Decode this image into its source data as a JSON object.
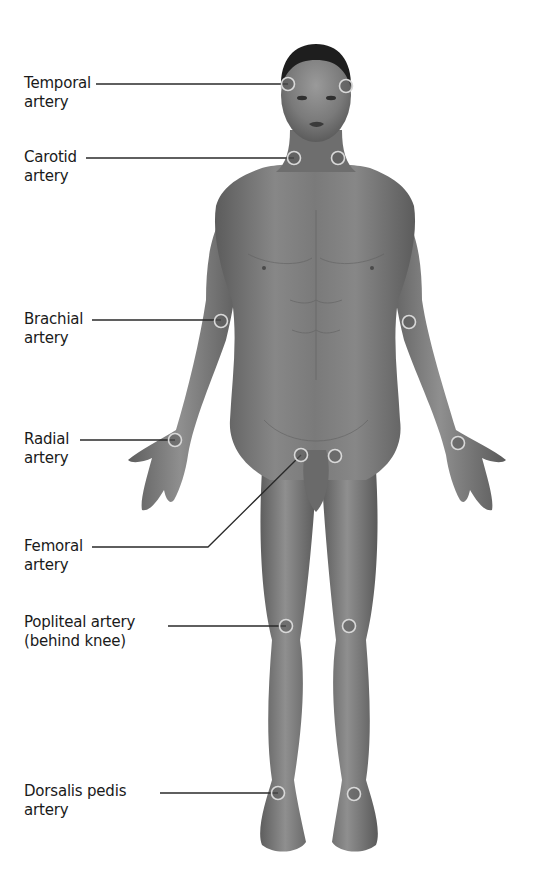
{
  "diagram": {
    "colors": {
      "background": "#ffffff",
      "skin_dark": "#5a5a5a",
      "skin_mid": "#7d7d7d",
      "skin_light": "#9a9a9a",
      "hair": "#1e1e1e",
      "marker_ring": "#d9d9d9",
      "leader_line": "#2a2a2a",
      "text": "#1a1a1a"
    },
    "labels": [
      {
        "id": "temporal",
        "line1": "Temporal",
        "line2": "artery",
        "x": 24,
        "y": 74,
        "leader": [
          [
            96,
            84
          ],
          [
            288,
            84
          ]
        ]
      },
      {
        "id": "carotid",
        "line1": "Carotid",
        "line2": "artery",
        "x": 24,
        "y": 148,
        "leader": [
          [
            86,
            158
          ],
          [
            294,
            158
          ]
        ]
      },
      {
        "id": "brachial",
        "line1": "Brachial",
        "line2": "artery",
        "x": 24,
        "y": 310,
        "leader": [
          [
            92,
            320
          ],
          [
            221,
            320
          ]
        ]
      },
      {
        "id": "radial",
        "line1": "Radial",
        "line2": "artery",
        "x": 24,
        "y": 430,
        "leader": [
          [
            80,
            440
          ],
          [
            175,
            440
          ]
        ]
      },
      {
        "id": "femoral",
        "line1": "Femoral",
        "line2": "artery",
        "x": 24,
        "y": 537,
        "leader": [
          [
            92,
            547
          ],
          [
            208,
            547
          ],
          [
            301,
            455
          ]
        ]
      },
      {
        "id": "popliteal",
        "line1": "Popliteal artery",
        "line2": "(behind knee)",
        "x": 24,
        "y": 613,
        "leader": [
          [
            168,
            626
          ],
          [
            286,
            626
          ]
        ]
      },
      {
        "id": "dorsalis-pedis",
        "line1": "Dorsalis pedis",
        "line2": "artery",
        "x": 24,
        "y": 782,
        "leader": [
          [
            160,
            793
          ],
          [
            278,
            793
          ]
        ]
      }
    ],
    "pulse_points": [
      {
        "id": "temporal-right",
        "x": 288,
        "y": 84
      },
      {
        "id": "temporal-left",
        "x": 346,
        "y": 86
      },
      {
        "id": "carotid-right",
        "x": 294,
        "y": 158
      },
      {
        "id": "carotid-left",
        "x": 338,
        "y": 158
      },
      {
        "id": "brachial-right",
        "x": 221,
        "y": 321
      },
      {
        "id": "brachial-left",
        "x": 409,
        "y": 322
      },
      {
        "id": "radial-right",
        "x": 175,
        "y": 440
      },
      {
        "id": "radial-left",
        "x": 458,
        "y": 443
      },
      {
        "id": "femoral-right",
        "x": 301,
        "y": 455
      },
      {
        "id": "femoral-left",
        "x": 335,
        "y": 456
      },
      {
        "id": "popliteal-right",
        "x": 286,
        "y": 626
      },
      {
        "id": "popliteal-left",
        "x": 349,
        "y": 626
      },
      {
        "id": "dorsalis-pedis-right",
        "x": 278,
        "y": 793
      },
      {
        "id": "dorsalis-pedis-left",
        "x": 354,
        "y": 794
      }
    ]
  }
}
